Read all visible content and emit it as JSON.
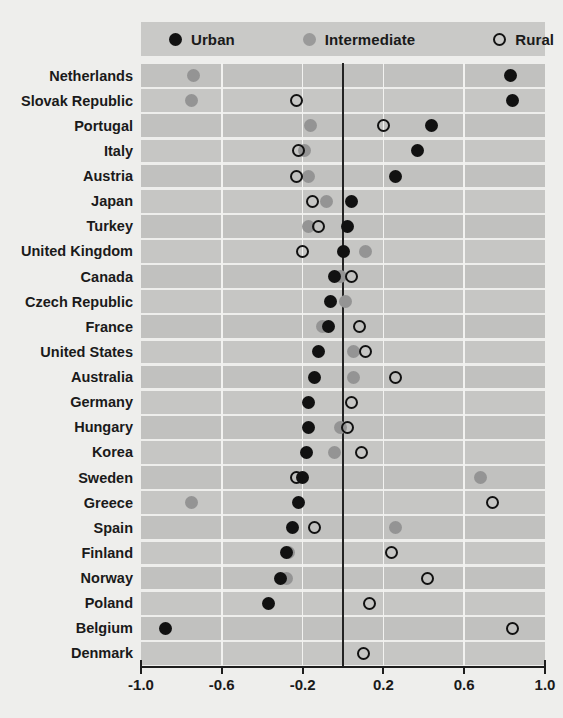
{
  "legend": {
    "items": [
      {
        "label": "Urban",
        "marker": "filled-black-circle-icon",
        "color": "#121212"
      },
      {
        "label": "Intermediate",
        "marker": "filled-gray-circle-icon",
        "color": "#9a9a9a"
      },
      {
        "label": "Rural",
        "marker": "open-circle-icon",
        "color": "#121212"
      }
    ],
    "background": "#c9c9c7"
  },
  "chart_data": {
    "type": "scatter",
    "title": "",
    "subtitle": "",
    "xlabel": "",
    "ylabel": "",
    "xlim": [
      -1.0,
      1.0
    ],
    "xticks": [
      -1.0,
      -0.6,
      -0.2,
      0.2,
      0.6,
      1.0
    ],
    "xticklabels": [
      "-1.0",
      "-0.6",
      "-0.2",
      "0.2",
      "0.6",
      "1.0"
    ],
    "grid": true,
    "gridlines_x": [
      -0.6,
      -0.2,
      0.2,
      0.6
    ],
    "zero_reference_line": 0.0,
    "legend_position": "top",
    "orientation": "horizontal-dot-plot",
    "categories": [
      "Netherlands",
      "Slovak Republic",
      "Portugal",
      "Italy",
      "Austria",
      "Japan",
      "Turkey",
      "United Kingdom",
      "Canada",
      "Czech Republic",
      "France",
      "United States",
      "Australia",
      "Germany",
      "Hungary",
      "Korea",
      "Sweden",
      "Greece",
      "Spain",
      "Finland",
      "Norway",
      "Poland",
      "Belgium",
      "Denmark"
    ],
    "series": [
      {
        "name": "Urban",
        "marker": "filled-black-circle",
        "color": "#111111",
        "values": [
          0.83,
          0.84,
          0.44,
          0.37,
          0.26,
          0.04,
          0.02,
          0.0,
          -0.04,
          -0.06,
          -0.07,
          -0.12,
          -0.14,
          -0.17,
          -0.17,
          -0.18,
          -0.2,
          -0.22,
          -0.25,
          -0.28,
          -0.31,
          -0.37,
          -0.88,
          null
        ]
      },
      {
        "name": "Intermediate",
        "marker": "filled-gray-circle",
        "color": "#949494",
        "values": [
          -0.74,
          -0.75,
          -0.16,
          -0.19,
          -0.17,
          -0.08,
          -0.17,
          0.11,
          -0.01,
          0.01,
          -0.1,
          0.05,
          0.05,
          null,
          -0.01,
          -0.04,
          0.68,
          -0.75,
          0.26,
          -0.27,
          -0.28,
          null,
          null,
          null
        ]
      },
      {
        "name": "Rural",
        "marker": "open-circle",
        "color": "#111111",
        "values": [
          null,
          -0.23,
          0.2,
          -0.22,
          -0.23,
          -0.15,
          -0.12,
          -0.2,
          0.04,
          null,
          0.08,
          0.11,
          0.26,
          0.04,
          0.02,
          0.09,
          -0.23,
          0.74,
          -0.14,
          0.24,
          0.42,
          0.13,
          0.84,
          0.1
        ]
      }
    ]
  }
}
